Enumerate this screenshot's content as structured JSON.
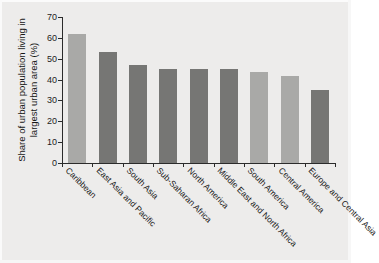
{
  "figure": {
    "background_color": "#edeceb",
    "axis_color": "#2b2b2b",
    "text_color": "#161616"
  },
  "chart_data": {
    "type": "bar",
    "title": "",
    "subtitle": "",
    "xlabel": "",
    "ylabel": "Share of urban population living in largest urban area (%)",
    "ylim": [
      0,
      70
    ],
    "yticks": [
      0,
      10,
      20,
      30,
      40,
      50,
      60,
      70
    ],
    "ytick_labels": [
      "0",
      "10",
      "20",
      "30",
      "40",
      "50",
      "60",
      "70"
    ],
    "grid": false,
    "legend": null,
    "categories": [
      "Caribbean",
      "East Asia and Pacific",
      "South Asia",
      "Sub-Saharan Africa",
      "North America",
      "Middle East and North Africa",
      "South America",
      "Central America",
      "Europe and Central Asia"
    ],
    "values": [
      62,
      53,
      47,
      45,
      45,
      45,
      43.5,
      41.5,
      35
    ],
    "bar_colors": [
      "#a9a9a7",
      "#767674",
      "#767674",
      "#767674",
      "#767674",
      "#767674",
      "#a9a9a7",
      "#a9a9a7",
      "#767674"
    ],
    "bar_color_light": "#a9a9a7",
    "bar_color_dark": "#767674"
  }
}
